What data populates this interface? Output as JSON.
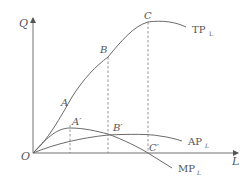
{
  "diagram": {
    "type": "production-curves",
    "axes": {
      "y_label": "Q",
      "x_label": "L",
      "origin_label": "O"
    },
    "curves": [
      {
        "id": "tp",
        "label_main": "TP",
        "label_sub": "L"
      },
      {
        "id": "ap",
        "label_main": "AP",
        "label_sub": "L"
      },
      {
        "id": "mp",
        "label_main": "MP",
        "label_sub": "L"
      }
    ],
    "points": {
      "A": "A",
      "B": "B",
      "C": "C",
      "A_prime": "A′",
      "B_prime": "B′",
      "C_prime": "C′"
    },
    "colors": {
      "line": "#6a6a6a",
      "text": "#555555"
    }
  }
}
